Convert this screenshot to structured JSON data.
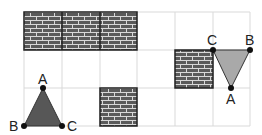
{
  "grid": {
    "cols": 6,
    "rows": 3,
    "x0": 24,
    "y0": 12,
    "cell": 37.7,
    "line_color": "#d9d9d9"
  },
  "brick_blocks": [
    {
      "name": "brick-wall-top",
      "col": 0,
      "row": 0,
      "cols": 3,
      "rows": 1
    },
    {
      "name": "brick-wall-bottom",
      "col": 2,
      "row": 2,
      "cols": 1,
      "rows": 1
    },
    {
      "name": "brick-wall-right",
      "col": 4,
      "row": 1,
      "cols": 1,
      "rows": 1
    }
  ],
  "colors": {
    "brick_fill": "#5a5a5a",
    "mortar": "#d8d8d8",
    "triangle_dark": "#575757",
    "triangle_light": "#a9a9a9",
    "vertex": "#111111"
  },
  "triangles": [
    {
      "name": "triangle-left",
      "fill": "dark",
      "vertices": {
        "A": {
          "label": "A",
          "x": 43,
          "y": 88
        },
        "B": {
          "label": "B",
          "x": 24,
          "y": 126
        },
        "C": {
          "label": "C",
          "x": 62,
          "y": 126
        }
      }
    },
    {
      "name": "triangle-right",
      "fill": "light",
      "vertices": {
        "A": {
          "label": "A",
          "x": 231,
          "y": 88
        },
        "B": {
          "label": "B",
          "x": 250,
          "y": 50
        },
        "C": {
          "label": "C",
          "x": 213,
          "y": 50
        }
      }
    }
  ],
  "labels": {
    "left_A": "A",
    "left_B": "B",
    "left_C": "C",
    "right_A": "A",
    "right_B": "B",
    "right_C": "C"
  }
}
